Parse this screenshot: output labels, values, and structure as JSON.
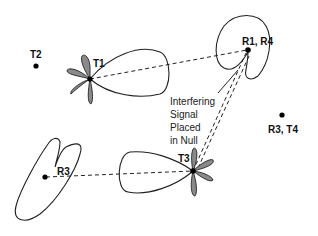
{
  "diagram": {
    "nodes": {
      "t1": {
        "label": "T1"
      },
      "t2": {
        "label": "T2"
      },
      "t3": {
        "label": "T3"
      },
      "r1r4": {
        "label": "R1, R4"
      },
      "r3t4": {
        "label": "R3, T4"
      },
      "r3": {
        "label": "R3"
      }
    },
    "annotation": {
      "lines": [
        "Interfering",
        "Signal",
        "Placed",
        "in Null"
      ]
    },
    "colors": {
      "stroke": "#222222",
      "petal_fill": "#8a8a8a",
      "background": "#ffffff"
    }
  }
}
